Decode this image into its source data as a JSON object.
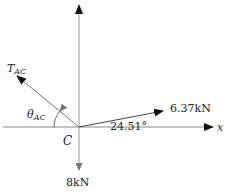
{
  "diagram": {
    "origin_label": "C",
    "x_axis_label": "x",
    "forces": [
      {
        "name": "T_AC",
        "label_main": "T",
        "label_sub": "AC",
        "direction": "up-left",
        "color": "#555555"
      },
      {
        "name": "applied-force",
        "label": "6.37kN",
        "angle_label": "24.51°",
        "direction": "up-right",
        "color": "#222222"
      },
      {
        "name": "weight",
        "label": "8kN",
        "direction": "down",
        "color": "#888888"
      }
    ],
    "angles": [
      {
        "name": "theta_AC",
        "label_main": "θ",
        "label_sub": "AC"
      },
      {
        "name": "force-angle",
        "label": "24.51°"
      }
    ],
    "colors": {
      "axis": "#999999",
      "force_dark": "#222222",
      "force_grey": "#555555",
      "weight": "#888888"
    }
  }
}
